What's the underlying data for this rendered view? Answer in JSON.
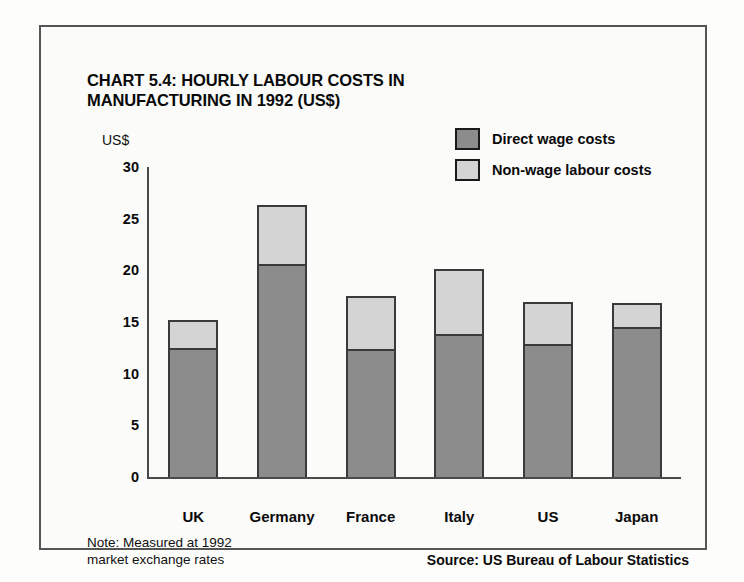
{
  "chart_data": {
    "type": "bar",
    "subtype": "stacked-bar",
    "title": "CHART 5.4: HOURLY LABOUR COSTS IN MANUFACTURING IN 1992 (US$)",
    "title_lines": [
      "CHART 5.4: HOURLY LABOUR COSTS IN",
      "MANUFACTURING IN 1992 (US$)"
    ],
    "xlabel": "",
    "ylabel": "US$",
    "ylim": [
      0,
      30
    ],
    "y_ticks": [
      30,
      25,
      20,
      15,
      10,
      5,
      0
    ],
    "grid": false,
    "legend_position": "top-right",
    "categories": [
      "UK",
      "Germany",
      "France",
      "Italy",
      "US",
      "Japan"
    ],
    "series": [
      {
        "name": "Direct wage costs",
        "color": "#8c8c8c",
        "values": [
          12.3,
          20.4,
          12.2,
          13.6,
          12.7,
          14.3
        ]
      },
      {
        "name": "Non-wage labour costs",
        "color": "#d4d4d4",
        "values": [
          2.7,
          5.7,
          5.1,
          6.3,
          4.0,
          2.3
        ]
      }
    ],
    "totals": [
      15.0,
      26.1,
      17.3,
      19.9,
      16.7,
      16.6
    ],
    "note": "Note: Measured at 1992 market exchange rates",
    "note_lines": [
      "Note: Measured at 1992",
      "market exchange rates"
    ],
    "source": "Source: US Bureau of Labour Statistics"
  },
  "legend": {
    "items": [
      {
        "label": "Direct wage costs",
        "color": "#8c8c8c"
      },
      {
        "label": "Non-wage labour costs",
        "color": "#d4d4d4"
      }
    ]
  },
  "colors": {
    "direct_wage": "#8c8c8c",
    "non_wage": "#d4d4d4",
    "border": "#3a3a3a",
    "axis": "#4a4a4a",
    "text": "#0a0a0a",
    "panel_bg": "#fbfbfa",
    "page_bg": "#fdfdfc"
  }
}
